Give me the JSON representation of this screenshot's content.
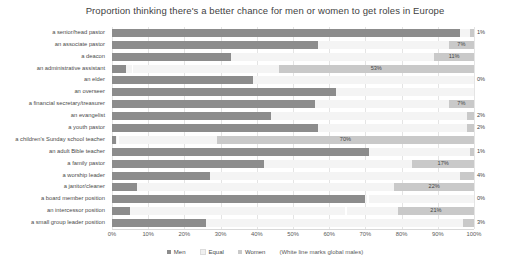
{
  "chart_data": {
    "type": "bar",
    "title": "Proportion thinking there's a better chance for men or women to get roles in Europe",
    "xlabel": "",
    "ylabel": "",
    "xlim": [
      0,
      100
    ],
    "grid": true,
    "stacked": true,
    "orientation": "horizontal",
    "legend_position": "bottom",
    "note": "(White line marks global males)",
    "xticks": [
      "0%",
      "10%",
      "20%",
      "30%",
      "40%",
      "50%",
      "60%",
      "70%",
      "80%",
      "90%",
      "100%"
    ],
    "xtick_values": [
      0,
      10,
      20,
      30,
      40,
      50,
      60,
      70,
      80,
      90,
      100
    ],
    "categories": [
      "a senior/head pastor",
      "an associate pastor",
      "a deacon",
      "an administrative assistant",
      "an elder",
      "an overseer",
      "a financial secretary/treasurer",
      "an evangelist",
      "a youth pastor",
      "a children's Sunday school teacher",
      "an adult Bible teacher",
      "a family pastor",
      "a worship leader",
      "a janitor/cleaner",
      "a board member position",
      "an intercessor position",
      "a small group leader position"
    ],
    "series": [
      {
        "name": "Men",
        "color": "#8c8c8c",
        "values": [
          96,
          57,
          33,
          4,
          39,
          62,
          56,
          44,
          57,
          1,
          71,
          42,
          27,
          7,
          70,
          5,
          26
        ]
      },
      {
        "name": "Equal",
        "color": "#f4f4f4",
        "values": [
          3,
          36,
          56,
          42,
          61,
          38,
          37,
          54,
          41,
          28,
          28,
          41,
          69,
          71,
          30,
          74,
          71
        ]
      },
      {
        "name": "Women",
        "color": "#c9c9c9",
        "values": [
          1,
          7,
          11,
          54,
          0,
          0,
          7,
          2,
          2,
          71,
          1,
          17,
          4,
          22,
          0,
          21,
          3
        ]
      }
    ],
    "global_male_markers": [
      null,
      null,
      null,
      5.5,
      null,
      null,
      null,
      null,
      null,
      1.5,
      null,
      null,
      null,
      null,
      70.5,
      64.5,
      null
    ],
    "data_labels": [
      {
        "row": 0,
        "text": "1%",
        "series": "Women",
        "placement": "outside"
      },
      {
        "row": 1,
        "text": "7%",
        "series": "Women",
        "placement": "inside"
      },
      {
        "row": 2,
        "text": "11%",
        "series": "Women",
        "placement": "inside"
      },
      {
        "row": 3,
        "text": "53%",
        "series": "Women",
        "placement": "inside"
      },
      {
        "row": 4,
        "text": "0%",
        "series": "Women",
        "placement": "outside"
      },
      {
        "row": 6,
        "text": "7%",
        "series": "Women",
        "placement": "inside"
      },
      {
        "row": 7,
        "text": "2%",
        "series": "Women",
        "placement": "outside"
      },
      {
        "row": 8,
        "text": "2%",
        "series": "Women",
        "placement": "outside"
      },
      {
        "row": 9,
        "text": "70%",
        "series": "Women",
        "placement": "inside"
      },
      {
        "row": 10,
        "text": "1%",
        "series": "Women",
        "placement": "outside"
      },
      {
        "row": 11,
        "text": "17%",
        "series": "Women",
        "placement": "inside"
      },
      {
        "row": 12,
        "text": "4%",
        "series": "Women",
        "placement": "outside"
      },
      {
        "row": 13,
        "text": "22%",
        "series": "Women",
        "placement": "inside"
      },
      {
        "row": 14,
        "text": "0%",
        "series": "Women",
        "placement": "outside"
      },
      {
        "row": 15,
        "text": "21%",
        "series": "Women",
        "placement": "inside"
      },
      {
        "row": 16,
        "text": "3%",
        "series": "Women",
        "placement": "outside"
      }
    ]
  },
  "legend": {
    "items": [
      {
        "label": "Men",
        "swatch": "men-swatch"
      },
      {
        "label": "Equal",
        "swatch": "equal-swatch"
      },
      {
        "label": "Women",
        "swatch": "women-swatch"
      }
    ],
    "note": "(White line marks global males)"
  }
}
